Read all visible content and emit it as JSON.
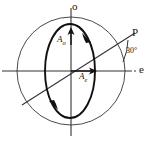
{
  "figure": {
    "axes": {
      "vertical_label": "o",
      "horizontal_label": "e"
    },
    "points": {
      "p_label": "P"
    },
    "angle": {
      "value": "30",
      "unit": "°",
      "text": "30°"
    },
    "vectors": [
      {
        "name": "A-o",
        "base": "A",
        "subscript": "o",
        "direction": "up"
      },
      {
        "name": "A-e",
        "base": "A",
        "subscript": "e",
        "direction": "right"
      }
    ],
    "colors": {
      "stroke": "#171717",
      "thin_stroke": "#555555",
      "background": "#ffffff"
    },
    "geometry": {
      "circle_center_x": 71,
      "circle_center_y": 71,
      "circle_radius": 54,
      "ellipse_center_x": 70,
      "ellipse_center_y": 71,
      "ellipse_rx": 25,
      "ellipse_ry": 47,
      "diagonal_angle_deg": 30
    }
  }
}
